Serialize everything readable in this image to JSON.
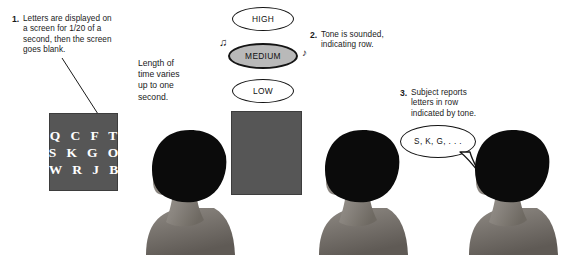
{
  "figure": {
    "background_color": "#ffffff",
    "ink_color": "#1a1a1a"
  },
  "steps": [
    {
      "number": "1.",
      "lines": [
        "Letters are displayed on",
        "a screen for 1/20 of a",
        "second, then the screen",
        "goes blank."
      ]
    },
    {
      "number": "2.",
      "lines": [
        "Tone is sounded,",
        "indicating row."
      ]
    },
    {
      "number": "3.",
      "lines": [
        "Subject reports",
        "letters in row",
        "indicated by tone."
      ]
    }
  ],
  "timing_note": {
    "lines": [
      "Length of",
      "time varies",
      "up to one",
      "second."
    ]
  },
  "letter_screen": {
    "label": "letter display screen",
    "background_color": "#565656",
    "text_color": "#ffffff",
    "rows": [
      "Q C F T",
      "S K G O",
      "W R J B"
    ]
  },
  "blank_screen": {
    "label": "blank screen",
    "background_color": "#565656"
  },
  "tones": {
    "label": "tone indicator",
    "options": [
      {
        "label": "HIGH",
        "state": "inactive"
      },
      {
        "label": "MEDIUM",
        "state": "active"
      },
      {
        "label": "LOW",
        "state": "inactive"
      }
    ],
    "active_color": "#b9b9b9",
    "note_glyph_left": "♫",
    "note_glyph_right": "♪"
  },
  "speech_bubble": {
    "label": "subject response",
    "text": "S, K, G, . . ."
  },
  "subjects": [
    {
      "label": "subject viewing letter screen"
    },
    {
      "label": "subject viewing blank screen"
    },
    {
      "label": "subject reporting letters"
    }
  ]
}
